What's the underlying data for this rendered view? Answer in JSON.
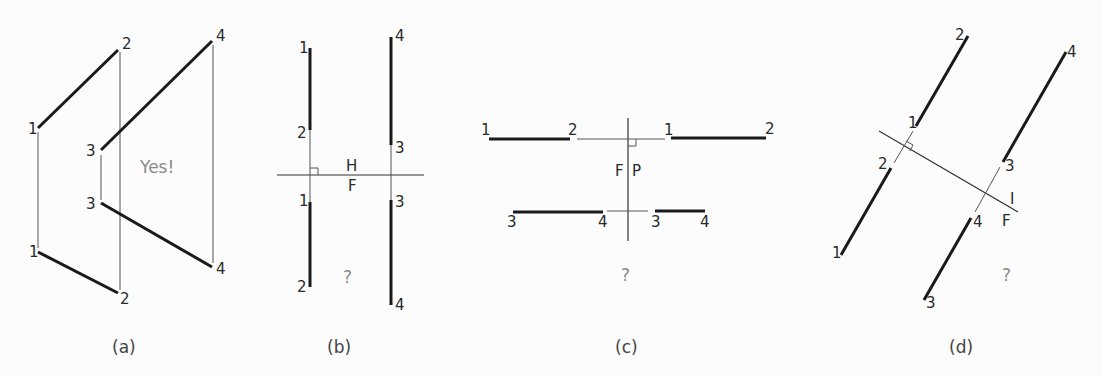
{
  "figure": {
    "panels": [
      {
        "id": "a",
        "caption": "(a)",
        "note": "Yes!",
        "labels": {
          "top_1": "1",
          "top_2": "2",
          "top_3": "3",
          "top_4": "4",
          "bottom_1": "1",
          "bottom_2": "2",
          "bottom_3": "3",
          "bottom_4": "4"
        }
      },
      {
        "id": "b",
        "caption": "(b)",
        "note": "?",
        "fold_line_labels": {
          "upper": "H",
          "lower": "F"
        },
        "labels": {
          "top_1": "1",
          "top_2": "2",
          "top_3": "3",
          "top_4": "4",
          "bottom_1": "1",
          "bottom_2": "2",
          "bottom_3": "3",
          "bottom_4": "4"
        }
      },
      {
        "id": "c",
        "caption": "(c)",
        "note": "?",
        "fold_line_labels": {
          "left": "F",
          "right": "P"
        },
        "labels": {
          "left_1": "1",
          "left_2": "2",
          "left_3": "3",
          "left_4": "4",
          "right_1": "1",
          "right_2": "2",
          "right_3": "3",
          "right_4": "4"
        }
      },
      {
        "id": "d",
        "caption": "(d)",
        "note": "?",
        "fold_line_labels": {
          "upper": "I",
          "lower": "F"
        },
        "labels": {
          "upper_1": "1",
          "upper_2": "2",
          "upper_3": "3",
          "upper_4": "4",
          "lower_1": "1",
          "lower_2": "2",
          "lower_3": "3",
          "lower_4": "4"
        }
      }
    ]
  }
}
